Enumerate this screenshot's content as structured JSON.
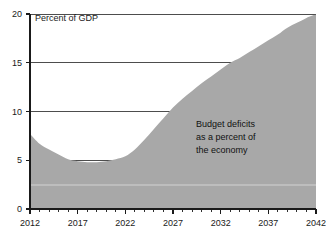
{
  "chart_data": {
    "type": "area",
    "title": "",
    "axis_note": "Percent of GDP",
    "xlabel": "",
    "ylabel": "",
    "ylim": [
      0,
      20
    ],
    "xlim": [
      2012,
      2042
    ],
    "ytick_values": [
      0,
      5,
      10,
      15,
      20
    ],
    "ytick_labels": [
      "0",
      "5",
      "10",
      "15",
      "20"
    ],
    "xtick_labels": [
      "2012",
      "2017",
      "2022",
      "2027",
      "2032",
      "2037",
      "2042"
    ],
    "xtick_values": [
      2012,
      2017,
      2022,
      2027,
      2032,
      2037,
      2042
    ],
    "grid": "horizontal",
    "legend": "none",
    "series_name": "Budget deficits as a percent of the economy",
    "fill_color": "#a8a8a8",
    "x": [
      2012,
      2013,
      2014,
      2015,
      2016,
      2017,
      2018,
      2019,
      2020,
      2021,
      2022,
      2023,
      2024,
      2025,
      2026,
      2027,
      2028,
      2029,
      2030,
      2031,
      2032,
      2033,
      2034,
      2035,
      2036,
      2037,
      2038,
      2039,
      2040,
      2041,
      2042
    ],
    "values": [
      7.7,
      6.7,
      6.1,
      5.6,
      5.1,
      4.9,
      4.8,
      4.8,
      4.9,
      5.1,
      5.4,
      6.1,
      7.1,
      8.2,
      9.3,
      10.4,
      11.3,
      12.1,
      12.9,
      13.6,
      14.3,
      15.0,
      15.5,
      16.1,
      16.7,
      17.3,
      17.9,
      18.6,
      19.1,
      19.6,
      20.0
    ],
    "annotations": [
      {
        "id": "series-callout",
        "lines": [
          "Budget deficits",
          "as a percent of",
          "the economy"
        ],
        "x": 2032,
        "y": 8.5
      }
    ]
  },
  "axes": {
    "y_axis_note": "Percent of GDP"
  }
}
